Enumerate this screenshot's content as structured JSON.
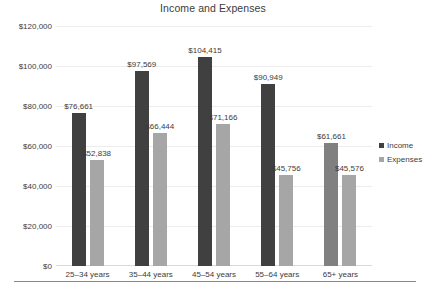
{
  "chart_data": {
    "type": "bar",
    "title": "Income and Expenses",
    "xlabel": "",
    "ylabel": "",
    "ylim": [
      0,
      120000
    ],
    "ytick_labels": [
      "$0",
      "$20,000",
      "$40,000",
      "$60,000",
      "$80,000",
      "$100,000",
      "$120,000"
    ],
    "ytick_values": [
      0,
      20000,
      40000,
      60000,
      80000,
      100000,
      120000
    ],
    "grid": true,
    "legend_position": "right",
    "categories": [
      "25–34 years",
      "35–44 years",
      "45–54 years",
      "55–64 years",
      "65+ years"
    ],
    "series": [
      {
        "name": "Income",
        "color": "#404040",
        "values": [
          76661,
          97569,
          104415,
          90949,
          61661
        ],
        "labels": [
          "$76,661",
          "$97,569",
          "$104,415",
          "$90,949",
          "$61,661"
        ]
      },
      {
        "name": "Expenses",
        "color": "#a6a6a6",
        "values": [
          52838,
          66444,
          71166,
          45756,
          45576
        ],
        "labels": [
          "$52,838",
          "$66,444",
          "$71,166",
          "$45,756",
          "$45,576"
        ]
      }
    ]
  }
}
